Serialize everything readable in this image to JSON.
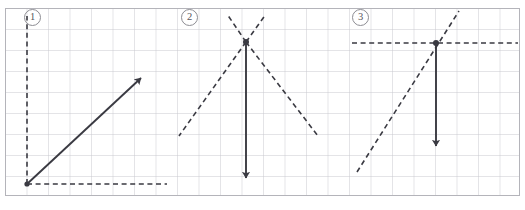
{
  "figure": {
    "width": 525,
    "height": 210,
    "background_color": "#ffffff"
  },
  "grid": {
    "name": "graph-paper-grid",
    "cell_size": 21.5,
    "line_color": "#c9c9cf",
    "border_color": "#b4b4ba",
    "columns": 24,
    "rows": 9,
    "origin_x": 5,
    "origin_y": 8,
    "width": 515,
    "height": 188
  },
  "colors": {
    "grid_line": "#c9c9cf",
    "grid_border": "#b4b4ba",
    "solid_vector": "#3a3a42",
    "dashed_line": "#3a3a42",
    "label_text": "#55555b",
    "label_border": "#8d8d93"
  },
  "panels": [
    {
      "id": "panel-1",
      "label": "①",
      "label_number": "1",
      "label_x": 24,
      "label_y": 9,
      "description": "Solid arrow pointing up-right at about 45 degrees from a point on a dashed horizontal baseline; a dashed vertical line rises from the same point.",
      "solid_vector": {
        "name": "resultant-vector-1",
        "x1": 27,
        "y1": 184,
        "x2": 145,
        "y2": 74,
        "arrow_at": "end",
        "direction_degrees": 43
      },
      "dashed_lines": [
        {
          "name": "dashed-vertical-axis-1",
          "x1": 27,
          "y1": 184,
          "x2": 27,
          "y2": 16,
          "orientation": "vertical"
        },
        {
          "name": "dashed-horizontal-axis-1",
          "x1": 27,
          "y1": 184,
          "x2": 167,
          "y2": 184,
          "orientation": "horizontal"
        }
      ],
      "vertex_dot": {
        "x": 27,
        "y": 184
      }
    },
    {
      "id": "panel-2",
      "label": "②",
      "label_number": "2",
      "label_x": 181,
      "label_y": 9,
      "description": "Solid arrow pointing straight down from an X crossing point; four dashed rays form an X through the top vertex.",
      "solid_vector": {
        "name": "resultant-vector-2",
        "x1": 246,
        "y1": 42,
        "x2": 246,
        "y2": 184,
        "arrow_at": "end",
        "direction_degrees": 270
      },
      "dashed_lines": [
        {
          "name": "dashed-ray-upper-left-2",
          "x1": 246,
          "y1": 42,
          "x2": 227,
          "y2": 14,
          "orientation": "diagonal"
        },
        {
          "name": "dashed-ray-upper-right-2",
          "x1": 246,
          "y1": 42,
          "x2": 266,
          "y2": 14,
          "orientation": "diagonal"
        },
        {
          "name": "dashed-ray-lower-left-2",
          "x1": 246,
          "y1": 42,
          "x2": 179,
          "y2": 136,
          "orientation": "diagonal"
        },
        {
          "name": "dashed-ray-lower-right-2",
          "x1": 246,
          "y1": 42,
          "x2": 318,
          "y2": 136,
          "orientation": "diagonal"
        }
      ],
      "vertex_dot": {
        "x": 246,
        "y": 42
      }
    },
    {
      "id": "panel-3",
      "label": "③",
      "label_number": "3",
      "label_x": 352,
      "label_y": 9,
      "description": "Solid arrow pointing straight down from the intersection of a dashed horizontal line and a dashed diagonal line rising to the right.",
      "solid_vector": {
        "name": "resultant-vector-3",
        "x1": 436,
        "y1": 43,
        "x2": 436,
        "y2": 152,
        "arrow_at": "end",
        "direction_degrees": 270
      },
      "dashed_lines": [
        {
          "name": "dashed-horizontal-line-3",
          "x1": 352,
          "y1": 43,
          "x2": 518,
          "y2": 43,
          "orientation": "horizontal"
        },
        {
          "name": "dashed-diagonal-line-3",
          "x1": 357,
          "y1": 172,
          "x2": 459,
          "y2": 11,
          "orientation": "diagonal"
        }
      ],
      "vertex_dot": {
        "x": 436,
        "y": 43
      }
    }
  ]
}
